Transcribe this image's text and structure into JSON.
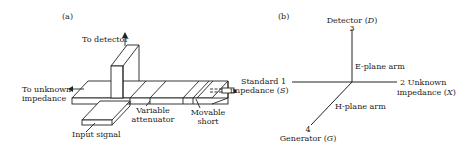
{
  "panel_a": {
    "label": "(a)",
    "to_detector": "To detector",
    "to_unknown_1": "To unknown",
    "to_unknown_2": "impedance",
    "input_signal": "Input signal",
    "variable_1": "Variable",
    "variable_2": "attenuator",
    "movable_1": "Movable",
    "movable_2": "short"
  },
  "panel_b": {
    "label": "(b)",
    "detector": "Detector (",
    "detector_sym": "D",
    "port3": "3",
    "e_plane": "E-plane arm",
    "standard_1": "Standard 1",
    "standard_2": "impedance (",
    "standard_sym": "S",
    "unknown_1": "2 Unknown",
    "unknown_2": "impedance (",
    "unknown_sym": "X",
    "h_plane": "H-plane arm",
    "port4": "4",
    "generator": "Generator (",
    "generator_sym": "G"
  }
}
